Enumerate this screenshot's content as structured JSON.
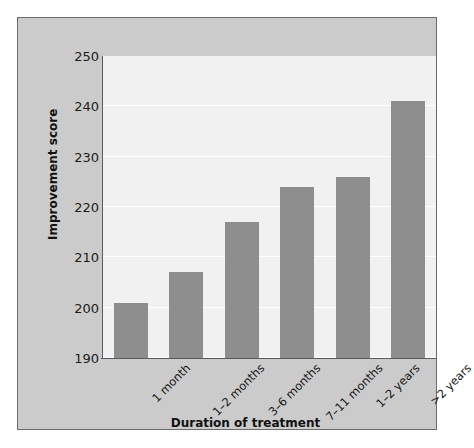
{
  "chart_data": {
    "type": "bar",
    "title": "",
    "xlabel": "Duration of treatment",
    "ylabel": "Improvement score",
    "categories": [
      "1 month",
      "1–2 months",
      "3–6 months",
      "7–11 months",
      "1–2 years",
      ">2 years"
    ],
    "values": [
      201,
      207,
      217,
      224,
      226,
      241
    ],
    "ylim": [
      190,
      250
    ],
    "yticks": [
      190,
      200,
      210,
      220,
      230,
      240,
      250
    ],
    "ytick_labels": [
      "190",
      "200",
      "210",
      "220",
      "230",
      "240",
      "250"
    ],
    "grid": true,
    "legend": false,
    "series": [
      {
        "name": "Improvement score",
        "values": [
          201,
          207,
          217,
          224,
          226,
          241
        ]
      }
    ]
  },
  "style": {
    "bar_color": "#8e8e8e",
    "plot_background": "#f1f1f1",
    "panel_background": "#cbcbcb",
    "border_color": "#6b6b6b",
    "gridline_color": "#fefefe",
    "axis_color": "#5a5a5a",
    "text_color": "#111111"
  }
}
